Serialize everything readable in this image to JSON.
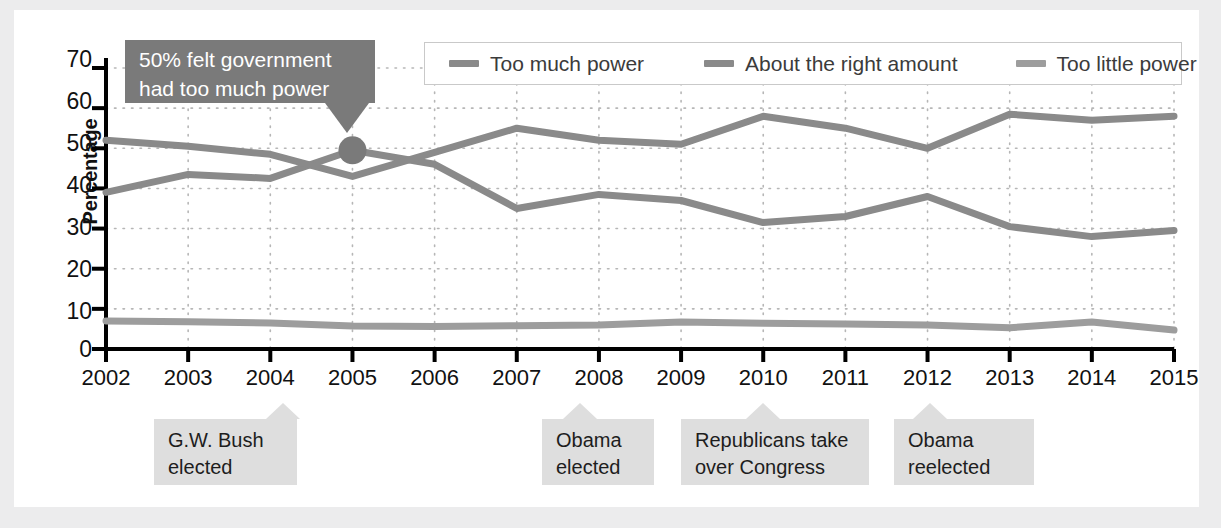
{
  "chart_data": {
    "type": "line",
    "title": "",
    "xlabel": "",
    "ylabel": "Percentage",
    "ylim": [
      0,
      70
    ],
    "ytick_step": 10,
    "grid": true,
    "legend_position": "top-right",
    "categories": [
      "2002",
      "2003",
      "2004",
      "2005",
      "2006",
      "2007",
      "2008",
      "2009",
      "2010",
      "2011",
      "2012",
      "2013",
      "2014",
      "2015"
    ],
    "series": [
      {
        "name": "Too much power",
        "color": "#8a8a8a",
        "values": [
          39,
          43.5,
          42.5,
          49.5,
          46,
          35,
          38.5,
          37,
          31.5,
          33,
          38,
          30.5,
          28,
          29.5
        ]
      },
      {
        "name": "About the right amount",
        "color": "#8a8a8a",
        "values": [
          52,
          50.5,
          48.5,
          43,
          49,
          55,
          52,
          51,
          58,
          55,
          50,
          58.5,
          57,
          58
        ]
      },
      {
        "name": "Too little power",
        "color": "#9d9d9d",
        "values": [
          7,
          6.8,
          6.5,
          5.7,
          5.6,
          5.8,
          6,
          6.7,
          6.4,
          6.2,
          6,
          5.3,
          6.7,
          4.7
        ]
      }
    ],
    "ytick_labels": [
      "70",
      "60",
      "50",
      "40",
      "30",
      "20",
      "10",
      "0"
    ],
    "annotation_marker": {
      "x": "2005",
      "y": 49.5
    }
  },
  "legend": {
    "items": [
      {
        "label": "Too much power",
        "color": "#8a8a8a"
      },
      {
        "label": "About the right amount",
        "color": "#8a8a8a"
      },
      {
        "label": "Too little power",
        "color": "#9d9d9d"
      }
    ]
  },
  "bubble": {
    "line1": "50% felt government",
    "line2": "had too much power",
    "background": "#7a7a7a",
    "text_color": "#ffffff"
  },
  "callouts": [
    {
      "line1": "G.W. Bush",
      "line2": "elected",
      "year": "2004"
    },
    {
      "line1": "Obama",
      "line2": "elected",
      "year": "2008"
    },
    {
      "line1": "Republicans take",
      "line2": "over Congress",
      "year": "2010"
    },
    {
      "line1": "Obama",
      "line2": "reelected",
      "year": "2012"
    }
  ],
  "colors": {
    "page_background": "#ececed",
    "card_background": "#ffffff",
    "axis": "#000000",
    "grid": "#b6b6b6",
    "callout_background": "#dedede"
  }
}
